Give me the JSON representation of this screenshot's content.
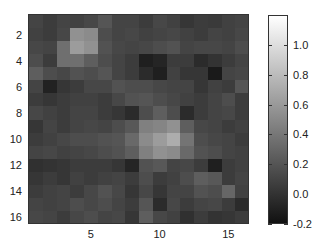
{
  "chart_data": {
    "type": "heatmap",
    "title": "",
    "xlabel": "",
    "ylabel": "",
    "colormap": "gray",
    "clim": [
      -0.2,
      1.2
    ],
    "x_ticks": [
      5,
      10,
      15
    ],
    "y_ticks": [
      2,
      4,
      6,
      8,
      10,
      12,
      14,
      16
    ],
    "colorbar_ticks": [
      1.0,
      0.8,
      0.6,
      0.4,
      0.2,
      0.0,
      -0.2
    ],
    "colorbar_tick_labels": [
      "1.0",
      "0.8",
      "0.6",
      "0.4",
      "0.2",
      "0.0",
      "-0.2"
    ],
    "rows": 16,
    "cols": 16,
    "values": [
      [
        0.1,
        0.05,
        0.1,
        0.08,
        0.12,
        0.2,
        0.1,
        0.1,
        0.05,
        0.12,
        0.08,
        0.02,
        0.05,
        0.04,
        0.08,
        0.1
      ],
      [
        0.08,
        0.05,
        0.12,
        0.55,
        0.52,
        0.15,
        0.1,
        0.12,
        0.08,
        0.1,
        0.12,
        0.08,
        0.05,
        0.1,
        0.08,
        0.12
      ],
      [
        0.12,
        0.1,
        0.35,
        0.62,
        0.55,
        0.18,
        0.12,
        0.1,
        0.12,
        0.15,
        0.18,
        0.1,
        0.12,
        0.12,
        0.1,
        0.15
      ],
      [
        0.15,
        0.05,
        0.35,
        0.35,
        0.25,
        0.15,
        0.1,
        0.05,
        -0.12,
        -0.08,
        0.05,
        0.05,
        -0.05,
        0.0,
        0.05,
        0.1
      ],
      [
        0.25,
        0.15,
        0.12,
        0.18,
        0.15,
        0.2,
        0.1,
        0.05,
        -0.05,
        -0.12,
        0.08,
        0.02,
        0.02,
        -0.15,
        0.1,
        0.12
      ],
      [
        0.1,
        -0.1,
        0.02,
        0.05,
        0.12,
        0.12,
        0.18,
        0.15,
        0.15,
        0.12,
        0.1,
        0.1,
        0.02,
        0.08,
        0.05,
        0.2
      ],
      [
        0.05,
        0.02,
        0.05,
        0.08,
        0.08,
        0.05,
        0.12,
        0.18,
        0.2,
        0.15,
        0.12,
        0.08,
        0.05,
        0.1,
        0.15,
        0.05
      ],
      [
        0.12,
        0.08,
        0.05,
        0.1,
        0.1,
        0.05,
        0.02,
        -0.05,
        0.15,
        0.25,
        0.15,
        -0.05,
        0.05,
        0.1,
        0.12,
        0.05
      ],
      [
        0.02,
        0.1,
        0.05,
        0.1,
        0.12,
        0.1,
        0.15,
        0.22,
        0.45,
        0.48,
        0.55,
        0.25,
        0.12,
        0.1,
        0.05,
        0.08
      ],
      [
        0.05,
        0.08,
        0.12,
        0.15,
        0.15,
        0.18,
        0.2,
        0.32,
        0.52,
        0.62,
        0.72,
        0.38,
        0.15,
        0.12,
        0.1,
        0.05
      ],
      [
        0.1,
        0.12,
        0.08,
        0.1,
        0.12,
        0.15,
        0.18,
        0.25,
        0.45,
        0.55,
        0.52,
        0.32,
        0.18,
        0.15,
        0.1,
        0.08
      ],
      [
        -0.02,
        0.0,
        0.02,
        0.05,
        0.05,
        0.05,
        0.02,
        -0.08,
        0.18,
        0.22,
        0.1,
        0.12,
        0.05,
        -0.12,
        0.05,
        0.08
      ],
      [
        0.02,
        0.05,
        0.02,
        0.08,
        0.05,
        0.08,
        0.1,
        0.05,
        0.15,
        0.05,
        0.08,
        0.15,
        0.25,
        0.22,
        0.05,
        0.1
      ],
      [
        0.05,
        0.08,
        0.1,
        0.05,
        0.12,
        0.18,
        0.12,
        0.02,
        0.12,
        0.02,
        0.1,
        0.1,
        0.18,
        0.15,
        0.3,
        0.08
      ],
      [
        0.1,
        0.08,
        0.1,
        0.15,
        0.12,
        0.15,
        0.1,
        0.05,
        0.2,
        -0.05,
        0.12,
        0.05,
        0.1,
        0.12,
        0.05,
        -0.05
      ],
      [
        0.12,
        0.1,
        0.05,
        0.12,
        0.15,
        0.1,
        0.12,
        0.02,
        0.25,
        0.12,
        0.08,
        -0.02,
        0.05,
        0.0,
        0.02,
        0.05
      ]
    ],
    "grid": false,
    "legend": "colorbar-right"
  }
}
